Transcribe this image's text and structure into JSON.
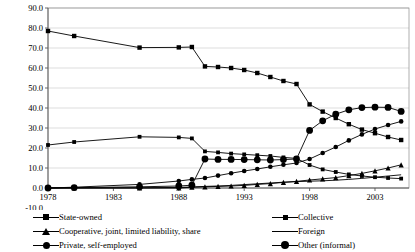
{
  "chart_data": {
    "type": "line",
    "title": "",
    "xlabel": "",
    "ylabel": "",
    "grid": true,
    "legend_position": "bottom",
    "xlim": [
      1978,
      2005
    ],
    "ylim": [
      -10.0,
      90.0
    ],
    "ytick_labels": [
      "90.0",
      "80.0",
      "70.0",
      "60.0",
      "50.0",
      "40.0",
      "30.0",
      "20.0",
      "10.0",
      "0.0",
      "-10.0"
    ],
    "ytick_values": [
      90.0,
      80.0,
      70.0,
      60.0,
      50.0,
      40.0,
      30.0,
      20.0,
      10.0,
      0.0,
      -10.0
    ],
    "xtick_labels": [
      "1978",
      "1983",
      "1988",
      "1993",
      "1998",
      "2003"
    ],
    "xtick_values": [
      1978,
      1983,
      1988,
      1993,
      1998,
      2003
    ],
    "x": [
      1978,
      1980,
      1985,
      1988,
      1989,
      1990,
      1991,
      1992,
      1993,
      1994,
      1995,
      1996,
      1997,
      1998,
      1999,
      2000,
      2001,
      2002,
      2003,
      2004,
      2005
    ],
    "series": [
      {
        "name": "State-owned",
        "marker": "square",
        "values": [
          78.5,
          76.0,
          70.2,
          70.3,
          70.5,
          60.8,
          60.5,
          60.0,
          59.0,
          57.5,
          55.5,
          53.5,
          52.0,
          41.8,
          38.2,
          35.0,
          31.9,
          29.2,
          27.4,
          25.5,
          24.0
        ]
      },
      {
        "name": "Collective",
        "marker": "square-small",
        "values": [
          21.5,
          23.0,
          25.6,
          25.3,
          24.8,
          18.3,
          17.8,
          17.2,
          16.8,
          16.4,
          16.0,
          15.3,
          14.8,
          11.5,
          9.3,
          8.0,
          6.8,
          6.0,
          5.4,
          5.0,
          4.7
        ]
      },
      {
        "name": "Cooperative, joint, limited liability, share",
        "marker": "triangle",
        "values": [
          0.0,
          0.0,
          0.0,
          0.0,
          0.4,
          0.6,
          0.8,
          1.0,
          1.3,
          1.8,
          2.2,
          2.8,
          3.3,
          4.0,
          4.6,
          5.2,
          6.2,
          7.3,
          8.6,
          10.0,
          11.6
        ]
      },
      {
        "name": "Foreign",
        "marker": "none",
        "values": [
          0.0,
          0.0,
          0.1,
          0.3,
          0.5,
          0.8,
          1.0,
          1.3,
          1.7,
          2.1,
          2.5,
          2.9,
          3.2,
          3.4,
          3.6,
          3.9,
          4.3,
          4.8,
          5.4,
          6.0,
          6.6
        ]
      },
      {
        "name": "Private, self-employed",
        "marker": "circle",
        "values": [
          0.0,
          0.4,
          1.8,
          3.5,
          4.3,
          5.0,
          6.2,
          7.4,
          8.5,
          9.5,
          10.6,
          11.6,
          12.5,
          14.5,
          17.5,
          20.5,
          23.8,
          26.8,
          29.5,
          31.5,
          33.3
        ]
      },
      {
        "name": "Other (informal)",
        "marker": "circle-large",
        "values": [
          0.0,
          0.2,
          0.6,
          1.0,
          1.4,
          14.5,
          14.3,
          14.3,
          14.2,
          14.1,
          14.0,
          14.2,
          14.5,
          28.8,
          33.6,
          36.9,
          39.1,
          40.2,
          40.4,
          40.3,
          38.3
        ]
      }
    ]
  },
  "legend": {
    "left": [
      {
        "label": "State-owned",
        "marker": "square"
      },
      {
        "label": "Cooperative, joint, limited liability, share",
        "marker": "triangle"
      },
      {
        "label": "Private, self-employed",
        "marker": "circle"
      }
    ],
    "right": [
      {
        "label": "Collective",
        "marker": "square-small"
      },
      {
        "label": "Foreign",
        "marker": "none"
      },
      {
        "label": "Other (informal)",
        "marker": "circle-large"
      }
    ]
  }
}
